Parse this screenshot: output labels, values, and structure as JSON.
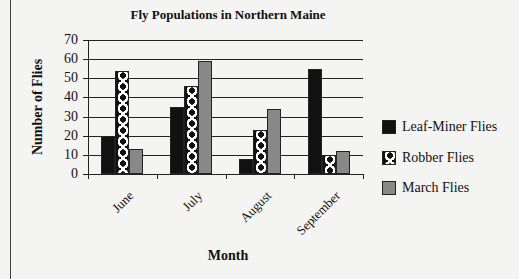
{
  "chart_data": {
    "type": "bar",
    "title": "Fly Populations in Northern Maine",
    "xlabel": "Month",
    "ylabel": "Number of Flies",
    "categories": [
      "June",
      "July",
      "August",
      "September"
    ],
    "series": [
      {
        "name": "Leaf-Miner Flies",
        "values": [
          20,
          35,
          8,
          55
        ],
        "color": "#111111",
        "pattern": "solid"
      },
      {
        "name": "Robber Flies",
        "values": [
          54,
          46,
          23,
          10
        ],
        "color": "#ffffff",
        "pattern": "dots"
      },
      {
        "name": "March Flies",
        "values": [
          13,
          59,
          34,
          12
        ],
        "color": "#888888",
        "pattern": "solid"
      }
    ],
    "ylim": [
      0,
      70
    ],
    "yticks": [
      0,
      10,
      20,
      30,
      40,
      50,
      60,
      70
    ],
    "grid": true,
    "legend_position": "right"
  },
  "labels": {
    "title": "Fly Populations in Northern Maine",
    "xlabel": "Month",
    "ylabel": "Number of Flies",
    "yticks": [
      "70",
      "60",
      "50",
      "40",
      "30",
      "20",
      "10",
      "0"
    ],
    "categories": [
      "June",
      "July",
      "August",
      "September"
    ],
    "legend": [
      "Leaf-Miner Flies",
      "Robber Flies",
      "March Flies"
    ]
  }
}
